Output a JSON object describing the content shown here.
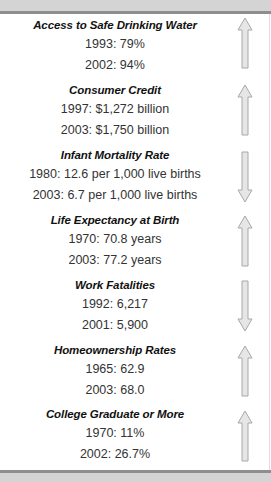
{
  "indicators": [
    {
      "title": "Access to Safe Drinking Water",
      "line1": "1993: 79%",
      "line2": "2002: 94%",
      "direction": "up"
    },
    {
      "title": "Consumer Credit",
      "line1": "1997: $1,272 billion",
      "line2": "2003: $1,750 billion",
      "direction": "up"
    },
    {
      "title": "Infant Mortality Rate",
      "line1": "1980: 12.6 per 1,000 live births",
      "line2": "2003: 6.7 per 1,000 live births",
      "direction": "down"
    },
    {
      "title": "Life Expectancy at Birth",
      "line1": "1970: 70.8 years",
      "line2": "2003: 77.2 years",
      "direction": "up"
    },
    {
      "title": "Work Fatalities",
      "line1": "1992: 6,217",
      "line2": "2001: 5,900",
      "direction": "down"
    },
    {
      "title": "Homeownership Rates",
      "line1": "1965: 62.9",
      "line2": "2003: 68.0",
      "direction": "up"
    },
    {
      "title": "College Graduate or More",
      "line1": "1970: 11%",
      "line2": "2002: 26.7%",
      "direction": "up"
    }
  ],
  "colors": {
    "arrow_fill": "#e6e6e6",
    "arrow_stroke": "#a8a8a8",
    "band": "#d4d4d4",
    "band_line": "#8e8e8e"
  }
}
